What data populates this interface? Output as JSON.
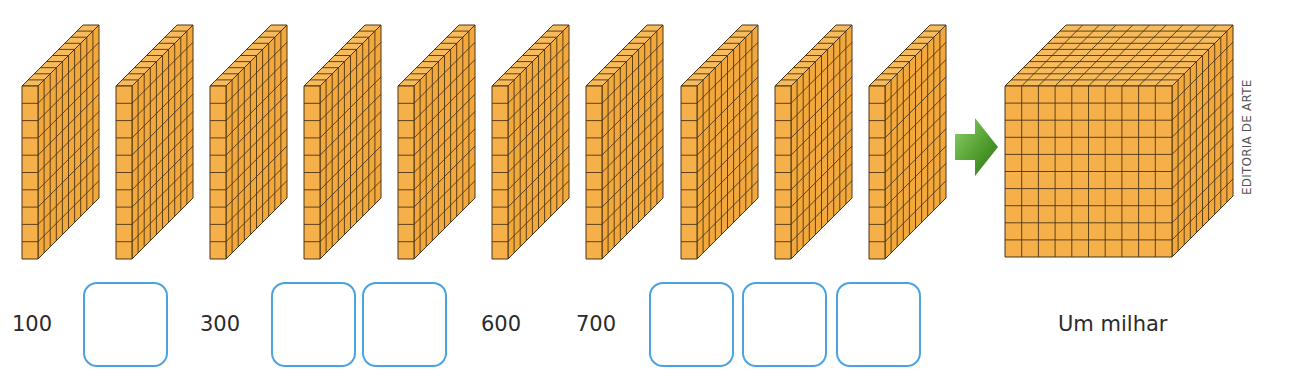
{
  "figure": {
    "slabs": {
      "count": 10,
      "units_per_slab": 100,
      "grid": "10x10",
      "x_positions": [
        22,
        116,
        210,
        304,
        398,
        492,
        586,
        681,
        775,
        869
      ]
    },
    "arrow": {
      "icon": "green-right-arrow-icon",
      "color": "#5aa832"
    },
    "cube": {
      "grid": "10x10x10",
      "units": 1000
    },
    "colors": {
      "face_front": "#f6b04a",
      "face_side": "#f3a83c",
      "face_top": "#f7bb5c",
      "edge": "#4a3418",
      "box_border": "#4aa3e0"
    }
  },
  "labels": {
    "n1": "100",
    "n2": "300",
    "n3": "600",
    "n4": "700",
    "result": "Um milhar"
  },
  "answer_boxes": [
    {
      "after": "100",
      "count": 1,
      "values": [
        ""
      ]
    },
    {
      "after": "300",
      "count": 2,
      "values": [
        "",
        ""
      ]
    },
    {
      "after": "700",
      "count": 3,
      "values": [
        "",
        "",
        ""
      ]
    }
  ],
  "credit": "EDITORIA DE ARTE"
}
